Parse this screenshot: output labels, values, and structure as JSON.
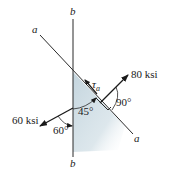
{
  "diagram": {
    "type": "stress element / inclined plane free-body diagram",
    "lines": {
      "plane_a": {
        "label_top": "a",
        "label_bottom": "a"
      },
      "plane_b": {
        "label_top": "b",
        "label_bottom": "b"
      }
    },
    "forces": {
      "normal_stress": {
        "label": "80 ksi"
      },
      "shear_stress": {
        "label_symbol": "τ",
        "label_subscript": "a"
      },
      "applied_stress": {
        "label": "60 ksi"
      }
    },
    "angles": {
      "between_planes": "45°",
      "normal_to_plane": "90°",
      "applied_to_b": "60°"
    },
    "colors": {
      "shade": "#c9d8e0",
      "line": "#2a2a2a"
    }
  }
}
